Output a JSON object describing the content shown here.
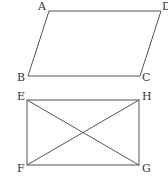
{
  "figures": [
    {
      "name": "parallelogram",
      "vertices": {
        "A": {
          "label": "A",
          "x": 49,
          "y": 11,
          "lx": 38,
          "ly": 10
        },
        "D": {
          "label": "D",
          "x": 161,
          "y": 11,
          "lx": 162,
          "ly": 10
        },
        "B": {
          "label": "B",
          "x": 28,
          "y": 76,
          "lx": 17,
          "ly": 81
        },
        "C": {
          "label": "C",
          "x": 140,
          "y": 76,
          "lx": 142,
          "ly": 81
        }
      }
    },
    {
      "name": "rectangle",
      "vertices": {
        "E": {
          "label": "E",
          "x": 27,
          "y": 100,
          "lx": 17,
          "ly": 100
        },
        "H": {
          "label": "H",
          "x": 139,
          "y": 100,
          "lx": 142,
          "ly": 100
        },
        "F": {
          "label": "F",
          "x": 27,
          "y": 165,
          "lx": 17,
          "ly": 172
        },
        "G": {
          "label": "G",
          "x": 139,
          "y": 165,
          "lx": 142,
          "ly": 172
        }
      },
      "diagonals": [
        "EG",
        "FH"
      ]
    }
  ]
}
